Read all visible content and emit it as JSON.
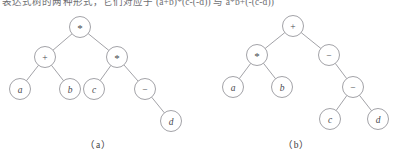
{
  "header": {
    "text": "表达式树的两种形式，它们对应于 (a+b)*(c-(-d)) 与 a*b+(-(c-d))"
  },
  "figure": {
    "trees": [
      {
        "id": "tree-a",
        "caption": "（a）",
        "nodes": [
          {
            "id": "a-root",
            "label": "*",
            "kind": "operator",
            "cx": 80,
            "cy": 20,
            "r": 10.5
          },
          {
            "id": "a-n2",
            "label": "+",
            "kind": "operator",
            "cx": 45,
            "cy": 50,
            "r": 10.5
          },
          {
            "id": "a-n3",
            "label": "*",
            "kind": "operator",
            "cx": 117,
            "cy": 50,
            "r": 10.5
          },
          {
            "id": "a-n4",
            "label": "a",
            "kind": "operand",
            "cx": 20,
            "cy": 82,
            "r": 10.5
          },
          {
            "id": "a-n5",
            "label": "b",
            "kind": "operand",
            "cx": 70,
            "cy": 82,
            "r": 10.5
          },
          {
            "id": "a-n6",
            "label": "c",
            "kind": "operand",
            "cx": 94,
            "cy": 82,
            "r": 10.5
          },
          {
            "id": "a-n7",
            "label": "−",
            "kind": "operator",
            "cx": 145,
            "cy": 82,
            "r": 10.5
          },
          {
            "id": "a-n8",
            "label": "d",
            "kind": "operand",
            "cx": 171,
            "cy": 114,
            "r": 10.5
          }
        ],
        "edges": [
          {
            "from": "a-root",
            "to": "a-n2"
          },
          {
            "from": "a-root",
            "to": "a-n3"
          },
          {
            "from": "a-n2",
            "to": "a-n4"
          },
          {
            "from": "a-n2",
            "to": "a-n5"
          },
          {
            "from": "a-n3",
            "to": "a-n6"
          },
          {
            "from": "a-n3",
            "to": "a-n7"
          },
          {
            "from": "a-n7",
            "to": "a-n8"
          }
        ]
      },
      {
        "id": "tree-b",
        "caption": "（b）",
        "nodes": [
          {
            "id": "b-root",
            "label": "+",
            "kind": "operator",
            "cx": 95,
            "cy": 19,
            "r": 10.5
          },
          {
            "id": "b-n2",
            "label": "*",
            "kind": "operator",
            "cx": 59,
            "cy": 48,
            "r": 10.5
          },
          {
            "id": "b-n3",
            "label": "−",
            "kind": "operator",
            "cx": 131,
            "cy": 48,
            "r": 10.5
          },
          {
            "id": "b-n4",
            "label": "a",
            "kind": "operand",
            "cx": 35,
            "cy": 80,
            "r": 10.5
          },
          {
            "id": "b-n5",
            "label": "b",
            "kind": "operand",
            "cx": 84,
            "cy": 80,
            "r": 10.5
          },
          {
            "id": "b-n6",
            "label": "−",
            "kind": "operator",
            "cx": 155,
            "cy": 80,
            "r": 10.5
          },
          {
            "id": "b-n7",
            "label": "c",
            "kind": "operand",
            "cx": 132,
            "cy": 112,
            "r": 10.5
          },
          {
            "id": "b-n8",
            "label": "d",
            "kind": "operand",
            "cx": 180,
            "cy": 112,
            "r": 10.5
          }
        ],
        "edges": [
          {
            "from": "b-root",
            "to": "b-n2"
          },
          {
            "from": "b-root",
            "to": "b-n3"
          },
          {
            "from": "b-n2",
            "to": "b-n4"
          },
          {
            "from": "b-n2",
            "to": "b-n5"
          },
          {
            "from": "b-n3",
            "to": "b-n6"
          },
          {
            "from": "b-n6",
            "to": "b-n7"
          },
          {
            "from": "b-n6",
            "to": "b-n8"
          }
        ]
      }
    ]
  },
  "colors": {
    "stroke": "#8a8a90",
    "label": "#4a4a50",
    "caption": "#3a3a40",
    "background": "#ffffff"
  }
}
